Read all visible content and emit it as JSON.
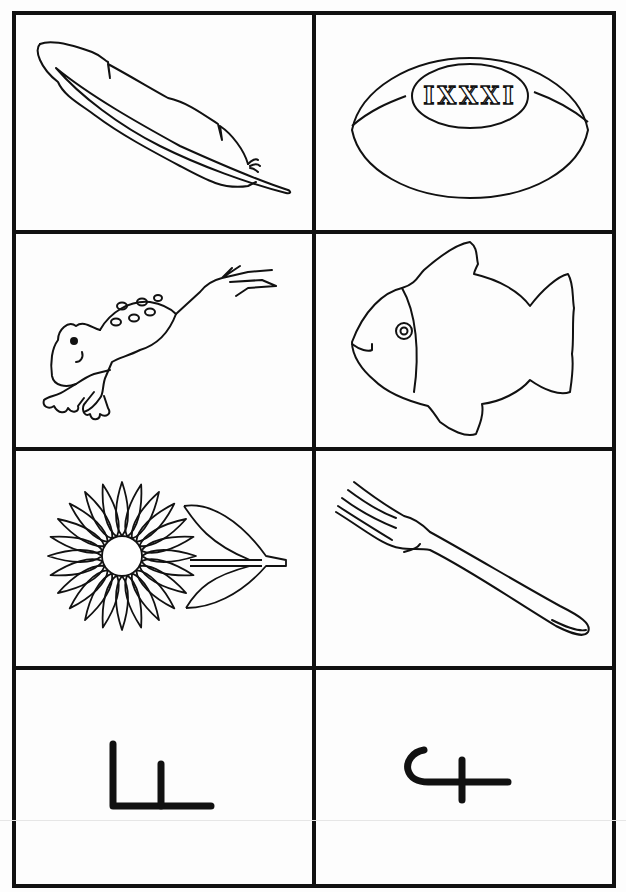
{
  "worksheet": {
    "layout": {
      "rows": 4,
      "columns": 2
    },
    "cards": [
      {
        "row": 1,
        "column": 1,
        "type": "picture",
        "subject": "feather",
        "icon": "feather-icon"
      },
      {
        "row": 1,
        "column": 2,
        "type": "picture",
        "subject": "rugby ball",
        "icon": "rugby-ball-icon",
        "ball_text": "IXXXI"
      },
      {
        "row": 2,
        "column": 1,
        "type": "picture",
        "subject": "frog",
        "icon": "frog-icon"
      },
      {
        "row": 2,
        "column": 2,
        "type": "picture",
        "subject": "fish",
        "icon": "fish-icon"
      },
      {
        "row": 3,
        "column": 1,
        "type": "picture",
        "subject": "flower",
        "icon": "flower-icon"
      },
      {
        "row": 3,
        "column": 2,
        "type": "picture",
        "subject": "fork",
        "icon": "fork-icon"
      },
      {
        "row": 4,
        "column": 1,
        "type": "glyph",
        "subject": "letter glyph (L with inner stroke)",
        "icon": "glyph-l-icon"
      },
      {
        "row": 4,
        "column": 2,
        "type": "glyph",
        "subject": "letter glyph (hook with cross)",
        "icon": "glyph-hook-cross-icon"
      }
    ],
    "colors": {
      "line": "#111111",
      "paper": "#fdfdfd"
    }
  }
}
